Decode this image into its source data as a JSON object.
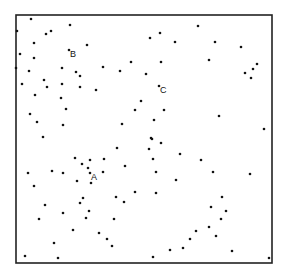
{
  "chart_data": {
    "type": "scatter",
    "title": "",
    "xlabel": "",
    "ylabel": "",
    "grid": false,
    "legend": null,
    "frame": {
      "x0": 16,
      "y0": 15,
      "x1": 272,
      "y1": 263
    },
    "annotations": [
      {
        "text": "A",
        "x": 90,
        "y": 173
      },
      {
        "text": "B",
        "x": 69,
        "y": 50
      },
      {
        "text": "C",
        "x": 159,
        "y": 86
      }
    ],
    "points": [
      [
        31,
        19
      ],
      [
        17,
        31
      ],
      [
        46,
        34
      ],
      [
        51,
        31
      ],
      [
        70,
        25
      ],
      [
        34,
        43
      ],
      [
        87,
        45
      ],
      [
        20,
        54
      ],
      [
        34,
        58
      ],
      [
        69,
        50
      ],
      [
        16,
        68
      ],
      [
        29,
        71
      ],
      [
        62,
        68
      ],
      [
        76,
        72
      ],
      [
        80,
        76
      ],
      [
        103,
        67
      ],
      [
        120,
        71
      ],
      [
        131,
        62
      ],
      [
        146,
        74
      ],
      [
        22,
        84
      ],
      [
        44,
        80
      ],
      [
        47,
        87
      ],
      [
        62,
        84
      ],
      [
        80,
        87
      ],
      [
        96,
        90
      ],
      [
        35,
        95
      ],
      [
        61,
        98
      ],
      [
        66,
        109
      ],
      [
        141,
        101
      ],
      [
        135,
        110
      ],
      [
        30,
        114
      ],
      [
        37,
        122
      ],
      [
        63,
        125
      ],
      [
        122,
        124
      ],
      [
        43,
        137
      ],
      [
        198,
        26
      ],
      [
        150,
        38
      ],
      [
        160,
        33
      ],
      [
        175,
        42
      ],
      [
        215,
        42
      ],
      [
        241,
        47
      ],
      [
        161,
        62
      ],
      [
        209,
        60
      ],
      [
        245,
        73
      ],
      [
        253,
        69
      ],
      [
        251,
        78
      ],
      [
        257,
        64
      ],
      [
        159,
        86
      ],
      [
        164,
        110
      ],
      [
        154,
        120
      ],
      [
        219,
        116
      ],
      [
        264,
        129
      ],
      [
        151,
        138
      ],
      [
        117,
        148
      ],
      [
        75,
        158
      ],
      [
        82,
        164
      ],
      [
        90,
        160
      ],
      [
        104,
        159
      ],
      [
        28,
        173
      ],
      [
        52,
        171
      ],
      [
        63,
        173
      ],
      [
        88,
        168
      ],
      [
        90,
        173
      ],
      [
        103,
        172
      ],
      [
        125,
        166
      ],
      [
        34,
        186
      ],
      [
        77,
        181
      ],
      [
        91,
        183
      ],
      [
        135,
        192
      ],
      [
        116,
        197
      ],
      [
        124,
        202
      ],
      [
        45,
        205
      ],
      [
        80,
        203
      ],
      [
        83,
        198
      ],
      [
        63,
        213
      ],
      [
        89,
        211
      ],
      [
        39,
        219
      ],
      [
        86,
        218
      ],
      [
        114,
        219
      ],
      [
        73,
        230
      ],
      [
        99,
        233
      ],
      [
        107,
        239
      ],
      [
        54,
        243
      ],
      [
        112,
        246
      ],
      [
        25,
        256
      ],
      [
        58,
        258
      ],
      [
        152,
        139
      ],
      [
        161,
        143
      ],
      [
        149,
        149
      ],
      [
        153,
        159
      ],
      [
        180,
        154
      ],
      [
        201,
        160
      ],
      [
        156,
        172
      ],
      [
        213,
        172
      ],
      [
        250,
        174
      ],
      [
        176,
        180
      ],
      [
        156,
        193
      ],
      [
        222,
        197
      ],
      [
        211,
        207
      ],
      [
        226,
        211
      ],
      [
        221,
        219
      ],
      [
        209,
        227
      ],
      [
        196,
        231
      ],
      [
        216,
        236
      ],
      [
        190,
        239
      ],
      [
        183,
        248
      ],
      [
        170,
        250
      ],
      [
        232,
        251
      ],
      [
        153,
        257
      ],
      [
        269,
        258
      ]
    ]
  }
}
